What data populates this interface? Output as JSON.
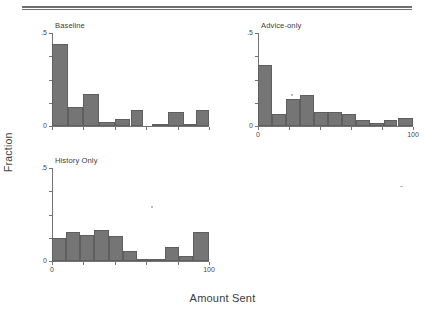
{
  "figure": {
    "y_axis_title": "Fraction",
    "x_axis_title": "Amount Sent",
    "bar_color": "#757575",
    "axis_color": "#737373"
  },
  "chart_data": {
    "type": "bar",
    "title": "",
    "xlabel": "Amount Sent",
    "ylabel": "Fraction",
    "xlim": [
      0,
      100
    ],
    "ylim": [
      0,
      0.5
    ],
    "grid": false,
    "legend": "none",
    "yticks": [
      0,
      0.125,
      0.25,
      0.375,
      0.5
    ],
    "ytick_labels": [
      "0",
      "",
      "",
      "",
      ".5"
    ],
    "xticks": [
      0,
      20,
      40,
      60,
      80,
      100
    ],
    "xtick_labels": [
      "0",
      "",
      "",
      "",
      "",
      "100"
    ],
    "panels": [
      {
        "name": "Baseline",
        "label": "Baseline",
        "bin_edges": [
          0,
          10,
          20,
          30,
          40,
          50,
          60,
          70,
          80,
          90,
          100
        ],
        "bin_centers": [
          5,
          15,
          25,
          35,
          45,
          55,
          65,
          75,
          85,
          95
        ],
        "values": [
          0.44,
          0.1,
          0.17,
          0.02,
          0.04,
          0.085,
          0.0,
          0.015,
          0.075,
          0.015,
          0.085
        ],
        "bars": [
          {
            "x0": 0,
            "x1": 10,
            "value": 0.44
          },
          {
            "x0": 10,
            "x1": 20,
            "value": 0.1
          },
          {
            "x0": 20,
            "x1": 30,
            "value": 0.17
          },
          {
            "x0": 30,
            "x1": 40,
            "value": 0.02
          },
          {
            "x0": 40,
            "x1": 50,
            "value": 0.04
          },
          {
            "x0": 50,
            "x1": 58,
            "value": 0.085
          },
          {
            "x0": 64,
            "x1": 74,
            "value": 0.013
          },
          {
            "x0": 74,
            "x1": 84,
            "value": 0.075
          },
          {
            "x0": 84,
            "x1": 92,
            "value": 0.013
          },
          {
            "x0": 92,
            "x1": 100,
            "value": 0.085
          }
        ]
      },
      {
        "name": "Advice-only",
        "label": "Advice-only",
        "bin_edges": [
          0,
          9,
          18,
          27,
          36,
          45,
          54,
          63,
          72,
          81,
          90,
          100
        ],
        "bin_centers": [
          4.5,
          13.5,
          22.5,
          31.5,
          40.5,
          49.5,
          58.5,
          67.5,
          76.5,
          85.5,
          95
        ],
        "values": [
          0.33,
          0.065,
          0.145,
          0.165,
          0.075,
          0.075,
          0.065,
          0.03,
          0.017,
          0.03,
          0.045
        ],
        "bars": [
          {
            "x0": 0,
            "x1": 9,
            "value": 0.33
          },
          {
            "x0": 9,
            "x1": 18,
            "value": 0.065
          },
          {
            "x0": 18,
            "x1": 27,
            "value": 0.145
          },
          {
            "x0": 27,
            "x1": 36,
            "value": 0.165
          },
          {
            "x0": 36,
            "x1": 45,
            "value": 0.075
          },
          {
            "x0": 45,
            "x1": 54,
            "value": 0.075
          },
          {
            "x0": 54,
            "x1": 63,
            "value": 0.065
          },
          {
            "x0": 63,
            "x1": 72,
            "value": 0.03
          },
          {
            "x0": 72,
            "x1": 81,
            "value": 0.017
          },
          {
            "x0": 81,
            "x1": 90,
            "value": 0.03
          },
          {
            "x0": 90,
            "x1": 100,
            "value": 0.045
          }
        ]
      },
      {
        "name": "History Only",
        "label": "History Only",
        "bin_edges": [
          0,
          9,
          18,
          27,
          36,
          45,
          54,
          63,
          72,
          81,
          90,
          100
        ],
        "bin_centers": [
          4.5,
          13.5,
          22.5,
          31.5,
          40.5,
          49.5,
          58.5,
          67.5,
          76.5,
          85.5,
          95
        ],
        "values": [
          0.125,
          0.155,
          0.14,
          0.165,
          0.135,
          0.055,
          0.012,
          0.012,
          0.075,
          0.028,
          0.155
        ],
        "bars": [
          {
            "x0": 0,
            "x1": 9,
            "value": 0.125
          },
          {
            "x0": 9,
            "x1": 18,
            "value": 0.155
          },
          {
            "x0": 18,
            "x1": 27,
            "value": 0.14
          },
          {
            "x0": 27,
            "x1": 36,
            "value": 0.165
          },
          {
            "x0": 36,
            "x1": 45,
            "value": 0.135
          },
          {
            "x0": 45,
            "x1": 54,
            "value": 0.055
          },
          {
            "x0": 54,
            "x1": 63,
            "value": 0.012
          },
          {
            "x0": 63,
            "x1": 72,
            "value": 0.012
          },
          {
            "x0": 72,
            "x1": 81,
            "value": 0.075
          },
          {
            "x0": 81,
            "x1": 90,
            "value": 0.028
          },
          {
            "x0": 90,
            "x1": 100,
            "value": 0.155
          }
        ]
      }
    ]
  }
}
